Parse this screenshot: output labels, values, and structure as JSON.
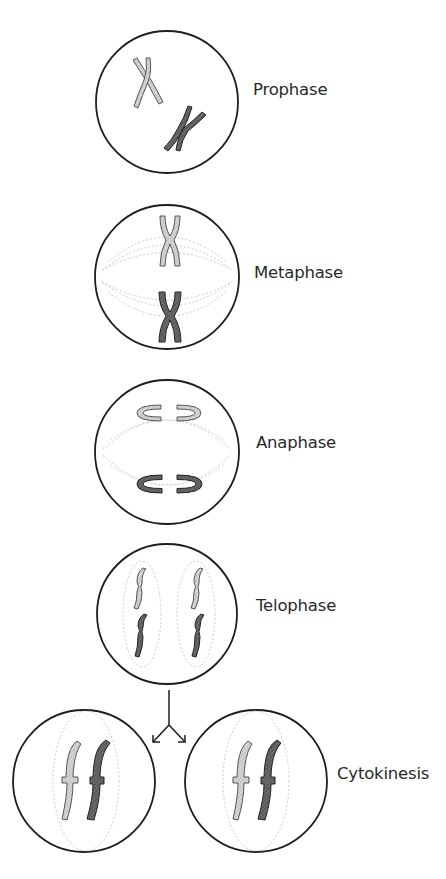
{
  "stages": [
    {
      "label": "Prophase"
    },
    {
      "label": "Metaphase"
    },
    {
      "label": "Anaphase"
    },
    {
      "label": "Telophase"
    },
    {
      "label": "Cytokinesis"
    }
  ],
  "colors": {
    "outline": "#1e1e1e",
    "chromosome_light": "#cfcfcf",
    "chromosome_dark": "#5a5a5a",
    "spindle": "#bdbdbd",
    "background": "#ffffff"
  }
}
